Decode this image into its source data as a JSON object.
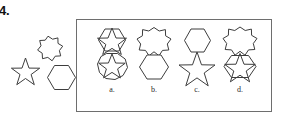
{
  "question": {
    "number_label": "4.",
    "type": "shape-overlap-matching"
  },
  "prompt": {
    "name": "prompt-shape-group",
    "shapes": [
      {
        "id": "eight-point-star",
        "label": "8-pointed star",
        "points": 8,
        "position": "top-right"
      },
      {
        "id": "five-point-star",
        "label": "5-pointed star",
        "points": 5,
        "position": "bottom-left"
      },
      {
        "id": "hexagon",
        "label": "hexagon",
        "sides": 6,
        "position": "bottom-right"
      }
    ]
  },
  "options": [
    {
      "key": "a",
      "label": "a.",
      "upper": "five-point-star-inside-hexagon",
      "lower": "five-point-star-inside-octagon",
      "arrangement": "stacked-touching"
    },
    {
      "key": "b",
      "label": "b.",
      "upper": "eight-point-star",
      "lower": "hexagon",
      "arrangement": "stacked-touching"
    },
    {
      "key": "c",
      "label": "c.",
      "upper": "hexagon",
      "lower": "five-point-star",
      "arrangement": "stacked-touching"
    },
    {
      "key": "d",
      "label": "d.",
      "upper": "eight-point-star",
      "lower": "five-point-star-overlapping-hexagon",
      "arrangement": "stacked-touching"
    }
  ],
  "style": {
    "stroke_color": "#3d3d3d",
    "frame_color": "#6e6e6e",
    "background": "#ffffff",
    "text_color": "#1a1a1a"
  }
}
